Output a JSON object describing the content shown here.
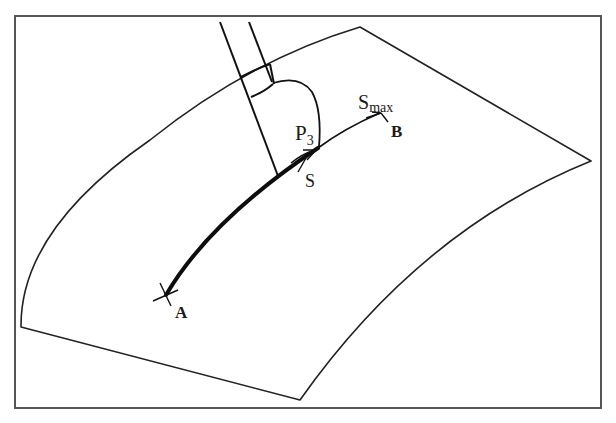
{
  "figure": {
    "colors": {
      "background": "#ffffff",
      "frame": "#555555",
      "ink": "#1a1a1a"
    },
    "labels": {
      "start_point": "A",
      "end_point": "B",
      "tool_point": "P",
      "tool_point_subscript": "3",
      "path_param": "S",
      "path_param_max": "S",
      "path_param_max_subscript": "max"
    }
  }
}
